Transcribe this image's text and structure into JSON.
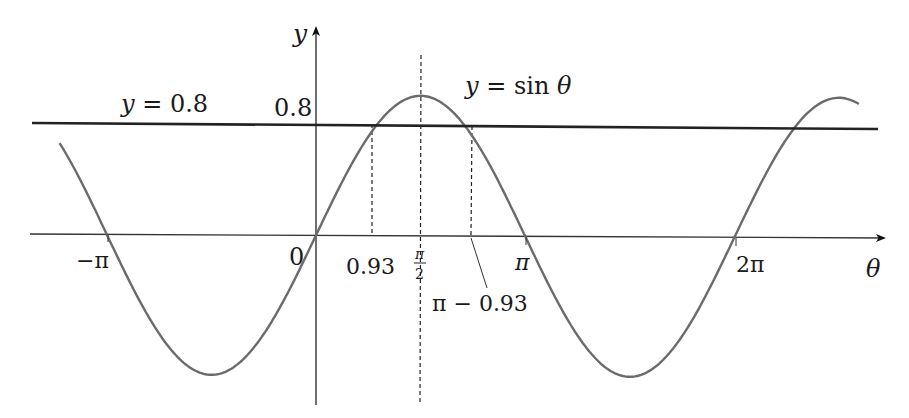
{
  "chart_data": {
    "type": "line",
    "title": "",
    "xlabel": "θ",
    "ylabel": "y",
    "series": [
      {
        "name": "y = sin θ",
        "function": "sin",
        "x_range": [
          -3.85,
          8.15
        ],
        "color": "#6b6b6b"
      },
      {
        "name": "y = 0.8",
        "function": "constant",
        "value": 0.8,
        "x_range": [
          -4.0,
          8.3
        ],
        "color": "#222222"
      }
    ],
    "x_ticks": [
      {
        "value": -3.14159,
        "label": "−π"
      },
      {
        "value": 0,
        "label": "0"
      },
      {
        "value": 0.93,
        "label": "0.93"
      },
      {
        "value": 1.5708,
        "label": "π/2"
      },
      {
        "value": 2.2116,
        "label": "π − 0.93"
      },
      {
        "value": 3.14159,
        "label": "π"
      },
      {
        "value": 6.28319,
        "label": "2π"
      }
    ],
    "y_ticks": [
      {
        "value": 0.8,
        "label": "0.8"
      }
    ],
    "reference_lines": [
      {
        "orientation": "vertical",
        "x": 0.93,
        "style": "dashed",
        "from_y": 0,
        "to_y": 0.8
      },
      {
        "orientation": "vertical",
        "x": 1.5708,
        "style": "dashed",
        "full_height": true
      },
      {
        "orientation": "vertical",
        "x": 2.2116,
        "style": "dashed",
        "from_y": 0,
        "to_y": 0.8
      }
    ],
    "intersections": [
      {
        "x": 0.93,
        "y": 0.8
      },
      {
        "x": 2.2116,
        "y": 0.8
      },
      {
        "x": -5.353,
        "y": 0.8
      },
      {
        "x": 7.213,
        "y": 0.8
      }
    ],
    "annotations": [
      {
        "text": "y = 0.8",
        "near": "horizontal line, left"
      },
      {
        "text": "y = sin θ",
        "near": "curve peak, right"
      },
      {
        "text": "π − 0.93",
        "near": "leader line to x-axis"
      }
    ],
    "xlim": [
      -4.0,
      8.5
    ],
    "ylim": [
      -1.2,
      1.35
    ],
    "grid": false,
    "legend": "none"
  },
  "labels": {
    "y_axis": "y",
    "x_axis": "θ",
    "line_label_prefix": "y = ",
    "line_label_value": "0.8",
    "y_tick_08": "0.8",
    "curve_label_prefix": "y = sin ",
    "curve_label_var": "θ",
    "origin": "0",
    "tick_neg_pi": "−π",
    "tick_093": "0.93",
    "tick_pi_half_num": "π",
    "tick_pi_half_den": "2",
    "tick_pi": "π",
    "tick_2pi": "2π",
    "tick_pi_minus_093": "π − 0.93"
  }
}
